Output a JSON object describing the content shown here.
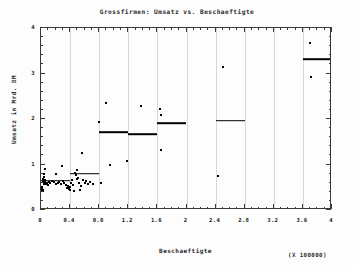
{
  "chart_data": {
    "type": "scatter",
    "title": "Grossfirmen: Umsatz vs. Beschaeftigte",
    "xlabel": "Beschaeftigte",
    "ylabel": "Umsatz in Mrd. DM",
    "x_multiplier_note": "(X 100000)",
    "xlim": [
      0,
      4
    ],
    "ylim": [
      0,
      4
    ],
    "grid": "vertical",
    "legend": null,
    "x_ticks": [
      0,
      0.4,
      0.8,
      1.2,
      1.6,
      2,
      2.4,
      2.8,
      3.2,
      3.6,
      4
    ],
    "x_tick_labels": [
      "0",
      "0.4",
      "0.8",
      "1.2",
      "1.6",
      "2",
      "2.4",
      "2.8",
      "3.2",
      "3.6",
      "4"
    ],
    "x_minor_per_major": 4,
    "y_ticks": [
      0,
      1,
      2,
      3,
      4
    ],
    "y_tick_labels": [
      "0",
      "1",
      "2",
      "3",
      "4"
    ],
    "y_minor_per_major": 5,
    "grid_x": [
      0.4,
      0.8,
      1.2,
      1.6,
      2,
      2.4,
      2.8,
      3.2,
      3.6
    ],
    "series": [
      {
        "name": "Firmen",
        "type": "scatter",
        "marker": "square",
        "color": "#000000",
        "points": [
          [
            0.015,
            0.5
          ],
          [
            0.018,
            0.46
          ],
          [
            0.02,
            0.44
          ],
          [
            0.022,
            0.42
          ],
          [
            0.028,
            0.43
          ],
          [
            0.03,
            0.63
          ],
          [
            0.032,
            0.68
          ],
          [
            0.035,
            0.73
          ],
          [
            0.038,
            0.79
          ],
          [
            0.04,
            0.61
          ],
          [
            0.045,
            0.57
          ],
          [
            0.05,
            0.9
          ],
          [
            0.055,
            0.66
          ],
          [
            0.06,
            0.62
          ],
          [
            0.07,
            0.58
          ],
          [
            0.085,
            0.6
          ],
          [
            0.095,
            0.55
          ],
          [
            0.11,
            0.62
          ],
          [
            0.13,
            0.59
          ],
          [
            0.15,
            0.63
          ],
          [
            0.175,
            0.61
          ],
          [
            0.2,
            0.58
          ],
          [
            0.21,
            0.79
          ],
          [
            0.23,
            0.6
          ],
          [
            0.25,
            0.62
          ],
          [
            0.27,
            0.57
          ],
          [
            0.29,
            0.97
          ],
          [
            0.3,
            0.64
          ],
          [
            0.32,
            0.6
          ],
          [
            0.34,
            0.56
          ],
          [
            0.355,
            0.49
          ],
          [
            0.365,
            0.48
          ],
          [
            0.375,
            0.52
          ],
          [
            0.385,
            0.47
          ],
          [
            0.395,
            0.51
          ],
          [
            0.4,
            0.45
          ],
          [
            0.415,
            0.6
          ],
          [
            0.43,
            0.65
          ],
          [
            0.44,
            0.55
          ],
          [
            0.455,
            0.41
          ],
          [
            0.47,
            0.82
          ],
          [
            0.48,
            0.76
          ],
          [
            0.49,
            0.88
          ],
          [
            0.5,
            0.68
          ],
          [
            0.51,
            0.71
          ],
          [
            0.52,
            0.6
          ],
          [
            0.53,
            0.44
          ],
          [
            0.545,
            0.52
          ],
          [
            0.56,
            1.26
          ],
          [
            0.58,
            0.66
          ],
          [
            0.6,
            0.59
          ],
          [
            0.62,
            0.63
          ],
          [
            0.65,
            0.57
          ],
          [
            0.68,
            0.61
          ],
          [
            0.72,
            0.58
          ],
          [
            0.8,
            1.93
          ],
          [
            0.82,
            0.6
          ],
          [
            0.9,
            2.36
          ],
          [
            0.95,
            0.99
          ],
          [
            1.18,
            1.07
          ],
          [
            1.37,
            2.28
          ],
          [
            1.64,
            2.21
          ],
          [
            1.65,
            2.08
          ],
          [
            1.655,
            1.32
          ],
          [
            2.43,
            0.74
          ],
          [
            2.5,
            3.14
          ],
          [
            3.7,
            3.67
          ],
          [
            3.71,
            2.93
          ]
        ]
      },
      {
        "name": "Klassenmittelwert",
        "type": "step",
        "color": "#000000",
        "segments": [
          {
            "x0": 0.0,
            "x1": 0.4,
            "y": 0.645
          },
          {
            "x0": 0.4,
            "x1": 0.8,
            "y": 0.795
          },
          {
            "x0": 0.8,
            "x1": 1.2,
            "y": 1.715
          },
          {
            "x0": 1.2,
            "x1": 1.6,
            "y": 1.665
          },
          {
            "x0": 1.6,
            "x1": 2.0,
            "y": 1.905
          },
          {
            "x0": 2.0,
            "x1": 2.4,
            "y": 0.005
          },
          {
            "x0": 2.4,
            "x1": 2.8,
            "y": 1.965
          },
          {
            "x0": 2.8,
            "x1": 3.6,
            "y": 0.0
          },
          {
            "x0": 3.6,
            "x1": 4.0,
            "y": 3.315
          }
        ]
      }
    ]
  }
}
